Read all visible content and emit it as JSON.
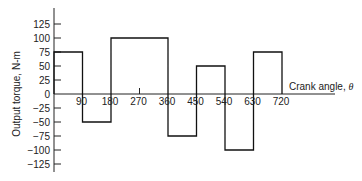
{
  "chart_data": {
    "type": "bar",
    "title": "",
    "xlabel": "Crank angle, θ",
    "ylabel": "Output torque, N-m",
    "x_ticks": [
      "90",
      "180",
      "270",
      "360",
      "450",
      "540",
      "630",
      "720"
    ],
    "y_ticks": [
      "125",
      "100",
      "75",
      "50",
      "25",
      "0",
      "-25",
      "-50",
      "-75",
      "-100",
      "-125"
    ],
    "ylim": [
      -125,
      125
    ],
    "xlim": [
      0,
      720
    ],
    "grid": false,
    "segments": [
      {
        "x_start": 0,
        "x_end": 90,
        "value": 75
      },
      {
        "x_start": 90,
        "x_end": 180,
        "value": -50
      },
      {
        "x_start": 180,
        "x_end": 360,
        "value": 100
      },
      {
        "x_start": 360,
        "x_end": 450,
        "value": -75
      },
      {
        "x_start": 450,
        "x_end": 540,
        "value": 50
      },
      {
        "x_start": 540,
        "x_end": 630,
        "value": -100
      },
      {
        "x_start": 630,
        "x_end": 720,
        "value": 75
      }
    ]
  }
}
